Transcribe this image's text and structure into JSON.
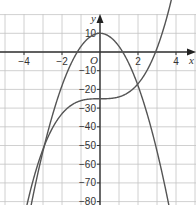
{
  "chart_data": {
    "type": "line",
    "title": "",
    "xlabel": "x",
    "ylabel": "y",
    "origin_label": "O",
    "xlim": [
      -5,
      5
    ],
    "ylim": [
      -85,
      20
    ],
    "grid": true,
    "x_tick_labels": [
      "−4",
      "−2",
      "2",
      "4"
    ],
    "x_ticks": [
      -4,
      -2,
      2,
      4
    ],
    "y_tick_labels": [
      "10",
      "−10",
      "−20",
      "−30",
      "−40",
      "−50",
      "−60",
      "−70",
      "−80"
    ],
    "y_ticks": [
      10,
      -10,
      -20,
      -30,
      -40,
      -50,
      -60,
      -70,
      -80
    ],
    "series": [
      {
        "name": "parabola",
        "equation": "y = 10 - 7x^2",
        "x": [
          -3.5,
          -3,
          -2,
          -1.2,
          0,
          1.2,
          2,
          3,
          3.5
        ],
        "y": [
          -75.75,
          -53,
          -18,
          0,
          10,
          0,
          -18,
          -53,
          -75.75
        ]
      },
      {
        "name": "cubic",
        "equation": "y = x^3 - 25",
        "x": [
          -3.5,
          -3,
          -2,
          -1,
          0,
          1,
          2,
          2.92,
          3.3
        ],
        "y": [
          -67.9,
          -52,
          -33,
          -26,
          -25,
          -24,
          -17,
          0,
          11
        ]
      }
    ],
    "intersections": [
      [
        -3,
        -52
      ],
      [
        2,
        -17
      ]
    ],
    "colors": {
      "curves": "#555555",
      "grid": "#bbbbbb",
      "axes": "#333333"
    }
  }
}
